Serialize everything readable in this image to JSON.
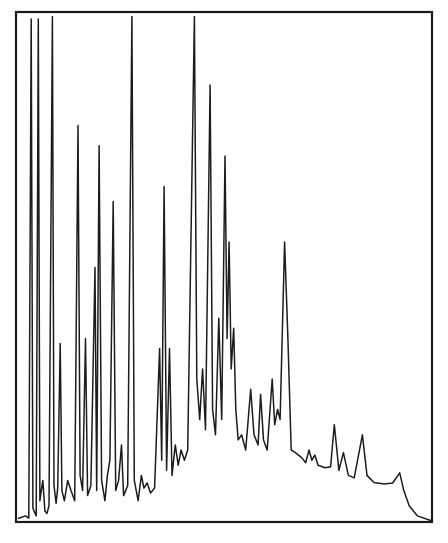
{
  "chart_data": {
    "type": "line",
    "title": "",
    "subtitle": "",
    "xlabel": "",
    "ylabel": "",
    "xticks": [],
    "yticks": [],
    "legend": [],
    "grid": false,
    "x_range": [
      0,
      100
    ],
    "y_range": [
      0,
      100
    ],
    "colors": {
      "trace": "#1c1c1c",
      "frame": "#1a1a1a",
      "background": "#ffffff"
    },
    "series": [
      {
        "name": "signal",
        "points": [
          [
            0.0,
            0.5
          ],
          [
            1.8,
            1.0
          ],
          [
            2.6,
            0.6
          ],
          [
            3.2,
            99
          ],
          [
            3.6,
            2.5
          ],
          [
            4.4,
            1.0
          ],
          [
            4.9,
            99
          ],
          [
            5.3,
            4.0
          ],
          [
            6.0,
            8.0
          ],
          [
            6.5,
            2.0
          ],
          [
            7.0,
            1.5
          ],
          [
            7.5,
            3.0
          ],
          [
            8.3,
            99.5
          ],
          [
            8.7,
            7.0
          ],
          [
            9.2,
            3.5
          ],
          [
            9.6,
            6.5
          ],
          [
            10.2,
            35.0
          ],
          [
            10.6,
            6.0
          ],
          [
            11.2,
            4.0
          ],
          [
            12.0,
            8.0
          ],
          [
            12.8,
            6.0
          ],
          [
            13.7,
            4.0
          ],
          [
            14.5,
            78.0
          ],
          [
            15.0,
            9.0
          ],
          [
            15.6,
            6.0
          ],
          [
            16.3,
            36.0
          ],
          [
            16.8,
            5.0
          ],
          [
            17.6,
            7.0
          ],
          [
            18.6,
            50.0
          ],
          [
            19.0,
            6.0
          ],
          [
            19.6,
            74.0
          ],
          [
            20.2,
            8.0
          ],
          [
            21.0,
            4.0
          ],
          [
            21.6,
            9.0
          ],
          [
            22.2,
            12.0
          ],
          [
            23.0,
            63.0
          ],
          [
            23.6,
            6.0
          ],
          [
            24.3,
            8.0
          ],
          [
            25.0,
            15.0
          ],
          [
            25.5,
            5.0
          ],
          [
            26.5,
            7.0
          ],
          [
            27.5,
            99.5
          ],
          [
            28.1,
            8.0
          ],
          [
            29.0,
            4.0
          ],
          [
            29.8,
            9.0
          ],
          [
            30.4,
            6.5
          ],
          [
            31.2,
            7.5
          ],
          [
            32.0,
            5.5
          ],
          [
            33.0,
            6.5
          ],
          [
            34.2,
            34.0
          ],
          [
            34.7,
            12.0
          ],
          [
            35.3,
            66.0
          ],
          [
            35.9,
            10.0
          ],
          [
            36.6,
            34.0
          ],
          [
            37.2,
            9.0
          ],
          [
            38.0,
            15.0
          ],
          [
            38.7,
            11.0
          ],
          [
            39.4,
            14.0
          ],
          [
            40.2,
            12.0
          ],
          [
            41.0,
            14.0
          ],
          [
            42.6,
            99.5
          ],
          [
            43.2,
            28.0
          ],
          [
            43.9,
            20.0
          ],
          [
            44.6,
            30.0
          ],
          [
            45.3,
            18.0
          ],
          [
            46.4,
            86.0
          ],
          [
            47.0,
            22.0
          ],
          [
            47.7,
            17.0
          ],
          [
            48.5,
            40.0
          ],
          [
            49.2,
            20.0
          ],
          [
            50.0,
            72.0
          ],
          [
            50.5,
            36.0
          ],
          [
            51.0,
            55.0
          ],
          [
            51.5,
            30.0
          ],
          [
            52.1,
            38.0
          ],
          [
            52.6,
            22.0
          ],
          [
            53.2,
            16.0
          ],
          [
            54.0,
            17.0
          ],
          [
            55.0,
            14.0
          ],
          [
            56.2,
            26.0
          ],
          [
            57.0,
            17.0
          ],
          [
            58.0,
            15.0
          ],
          [
            58.6,
            25.0
          ],
          [
            59.3,
            16.0
          ],
          [
            60.2,
            14.0
          ],
          [
            61.4,
            28.0
          ],
          [
            62.0,
            19.0
          ],
          [
            62.7,
            22.0
          ],
          [
            63.3,
            20.0
          ],
          [
            64.4,
            55.0
          ],
          [
            65.2,
            36.0
          ],
          [
            66.0,
            14.0
          ],
          [
            67.0,
            13.5
          ],
          [
            68.5,
            12.5
          ],
          [
            69.5,
            11.5
          ],
          [
            70.3,
            14.0
          ],
          [
            71.0,
            12.0
          ],
          [
            71.7,
            13.0
          ],
          [
            72.5,
            11.0
          ],
          [
            74.2,
            10.5
          ],
          [
            75.5,
            10.7
          ],
          [
            76.4,
            19.0
          ],
          [
            77.5,
            10.0
          ],
          [
            78.6,
            13.5
          ],
          [
            79.8,
            9.0
          ],
          [
            81.2,
            8.5
          ],
          [
            83.2,
            17.0
          ],
          [
            84.3,
            9.0
          ],
          [
            86.0,
            7.6
          ],
          [
            88.5,
            7.3
          ],
          [
            90.5,
            7.5
          ],
          [
            92.2,
            9.5
          ],
          [
            93.2,
            6.0
          ],
          [
            94.5,
            3.0
          ],
          [
            96.5,
            1.0
          ],
          [
            100.0,
            0.0
          ]
        ]
      }
    ]
  },
  "plot_area": {
    "left": 16,
    "top": 12,
    "right": 432,
    "bottom": 522
  }
}
